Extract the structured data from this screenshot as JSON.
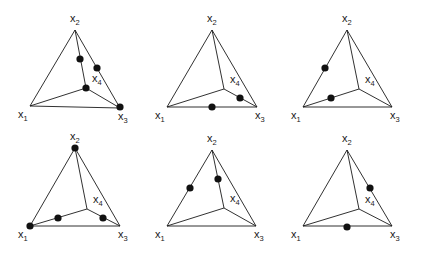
{
  "figure": {
    "vertex_labels": {
      "x1": "x",
      "x2": "x",
      "x3": "x",
      "x4": "x",
      "sub1": "1",
      "sub2": "2",
      "sub3": "3",
      "sub4": "4"
    },
    "panels": [
      {
        "id": "panel-1",
        "x1": [
          30,
          106
        ],
        "x2": [
          75,
          30
        ],
        "x3": [
          120,
          108
        ],
        "x4": [
          86,
          88
        ],
        "dots": [
          [
            80,
            59
          ],
          [
            97,
            68
          ],
          [
            86,
            88
          ],
          [
            120,
            107
          ]
        ]
      },
      {
        "id": "panel-2",
        "x1": [
          167,
          107
        ],
        "x2": [
          212,
          30
        ],
        "x3": [
          257,
          107
        ],
        "x4": [
          224,
          89
        ],
        "dots": [
          [
            212,
            107
          ],
          [
            240,
            98
          ]
        ]
      },
      {
        "id": "panel-3",
        "x1": [
          303,
          107
        ],
        "x2": [
          347,
          30
        ],
        "x3": [
          392,
          107
        ],
        "x4": [
          359,
          89
        ],
        "dots": [
          [
            325,
            68
          ],
          [
            331,
            98
          ]
        ]
      },
      {
        "id": "panel-4",
        "x1": [
          30,
          226
        ],
        "x2": [
          75,
          148
        ],
        "x3": [
          120,
          226
        ],
        "x4": [
          87,
          209
        ],
        "dots": [
          [
            75,
            148
          ],
          [
            30,
            226
          ],
          [
            58,
            218
          ],
          [
            103,
            218
          ]
        ]
      },
      {
        "id": "panel-5",
        "x1": [
          167,
          226
        ],
        "x2": [
          212,
          150
        ],
        "x3": [
          256,
          226
        ],
        "x4": [
          224,
          208
        ],
        "dots": [
          [
            190,
            188
          ],
          [
            218,
            179
          ]
        ]
      },
      {
        "id": "panel-6",
        "x1": [
          303,
          226
        ],
        "x2": [
          347,
          150
        ],
        "x3": [
          392,
          226
        ],
        "x4": [
          359,
          209
        ],
        "dots": [
          [
            370,
            188
          ],
          [
            347,
            227
          ]
        ]
      }
    ]
  }
}
